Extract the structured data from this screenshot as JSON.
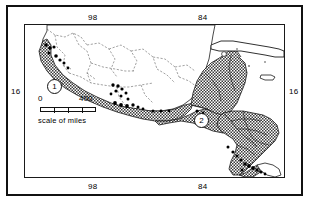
{
  "figure": {
    "kind": "distribution-map",
    "title_present": false
  },
  "axes": {
    "top": [
      {
        "label": "98",
        "position_pct": 27.2
      },
      {
        "label": "84",
        "position_pct": 69.3
      }
    ],
    "bottom": [
      {
        "label": "98",
        "position_pct": 27.2
      },
      {
        "label": "84",
        "position_pct": 69.3
      }
    ],
    "left": [
      {
        "label": "16",
        "position_pct": 44.2
      }
    ],
    "right": [
      {
        "label": "16",
        "position_pct": 44.2
      }
    ],
    "units": "degrees"
  },
  "scale_bar": {
    "min_label": "0",
    "max_label": "400",
    "caption": "scale of miles",
    "divisions": 4
  },
  "region_markers": [
    {
      "id": "1",
      "label": "1"
    },
    {
      "id": "2",
      "label": "2"
    }
  ],
  "colors": {
    "ink": "#111111",
    "paper": "#ffffff",
    "shaded_fill": "#8d8d8d",
    "dot": "#000000"
  },
  "map_features": {
    "shaded_range": "Pacific slope of Mexico through Central America",
    "landmasses": [
      "Mexico",
      "Guatemala",
      "Belize",
      "Honduras",
      "El Salvador",
      "Nicaragua",
      "Costa Rica",
      "Panama",
      "Cuba",
      "Jamaica"
    ],
    "locality_dot_count": 38
  }
}
